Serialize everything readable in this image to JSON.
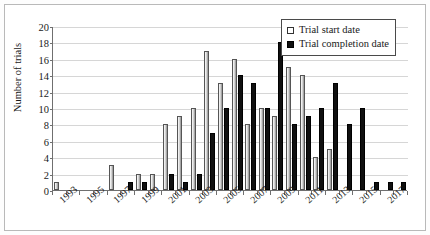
{
  "chart_data": {
    "type": "bar",
    "title": "",
    "xlabel": "",
    "ylabel": "Number of trials",
    "ylim": [
      0,
      20
    ],
    "ytick_step": 2,
    "yticks": [
      0,
      2,
      4,
      6,
      8,
      10,
      12,
      14,
      16,
      18,
      20
    ],
    "grid": true,
    "legend_position": "top-right",
    "categories": [
      "1993",
      "1994",
      "1995",
      "1996",
      "1997",
      "1998",
      "1999",
      "2000",
      "2001",
      "2002",
      "2003",
      "2004",
      "2005",
      "2006",
      "2007",
      "2008",
      "2009",
      "2010",
      "2011",
      "2012",
      "2013",
      "2014",
      "2015",
      "2016",
      "2017",
      "2018"
    ],
    "tick_labels": [
      "1993",
      "",
      "1995",
      "",
      "1997",
      "",
      "1999",
      "",
      "2001",
      "",
      "2003",
      "",
      "2005",
      "",
      "2007",
      "",
      "2009",
      "",
      "2011",
      "",
      "2013",
      "",
      "2015",
      "",
      "2017",
      ""
    ],
    "series": [
      {
        "name": "Trial start date",
        "color": "#d9d9d9",
        "values": [
          1,
          0,
          0,
          0,
          3,
          0,
          2,
          2,
          8,
          9,
          10,
          17,
          13,
          16,
          8,
          10,
          9,
          15,
          14,
          4,
          5,
          0,
          0,
          0,
          0,
          0
        ]
      },
      {
        "name": "Trial completion date",
        "color": "#101010",
        "values": [
          0,
          0,
          0,
          0,
          0,
          1,
          1,
          0,
          2,
          1,
          2,
          7,
          10,
          14,
          13,
          10,
          18,
          8,
          9,
          10,
          13,
          8,
          10,
          1,
          1,
          1
        ]
      }
    ]
  },
  "legend": {
    "items": [
      {
        "label": "Trial start date"
      },
      {
        "label": "Trial completion date"
      }
    ]
  },
  "axes": {
    "y_title": "Number of trials"
  }
}
